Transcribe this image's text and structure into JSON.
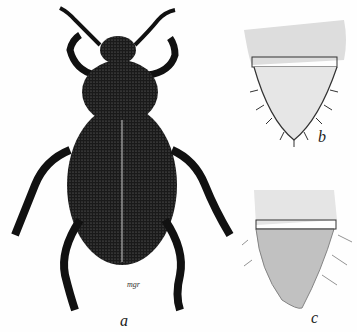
{
  "figure": {
    "labels": {
      "a": "a",
      "b": "b",
      "c": "c"
    },
    "signature": "mgr",
    "colors": {
      "ink": "#111111",
      "paper": "#fefefe"
    }
  }
}
